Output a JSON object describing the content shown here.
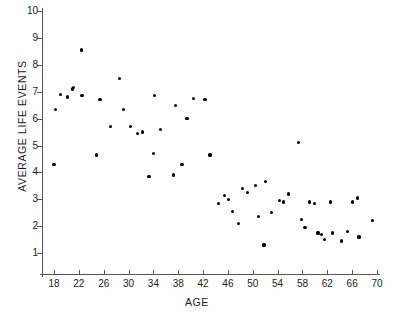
{
  "chart_data": {
    "type": "scatter",
    "title": "",
    "xlabel": "AGE",
    "ylabel": "AVERAGE LIFE EVENTS",
    "xlim": [
      16,
      71
    ],
    "ylim": [
      0.4,
      10
    ],
    "grid": false,
    "legend": null,
    "xticks": [
      18,
      22,
      26,
      30,
      34,
      38,
      42,
      46,
      50,
      54,
      58,
      62,
      66,
      70
    ],
    "yticks": [
      1,
      2,
      3,
      4,
      5,
      6,
      7,
      8,
      9,
      10
    ],
    "marker": "filled-circle",
    "marker_color": "#000000",
    "points": [
      {
        "x": 18.0,
        "y": 4.3
      },
      {
        "x": 18.3,
        "y": 6.35
      },
      {
        "x": 19.0,
        "y": 6.9
      },
      {
        "x": 20.2,
        "y": 6.8
      },
      {
        "x": 21.0,
        "y": 7.1
      },
      {
        "x": 21.2,
        "y": 7.15
      },
      {
        "x": 22.4,
        "y": 8.55
      },
      {
        "x": 22.5,
        "y": 6.85
      },
      {
        "x": 24.8,
        "y": 4.65
      },
      {
        "x": 25.4,
        "y": 6.7
      },
      {
        "x": 27.1,
        "y": 5.7
      },
      {
        "x": 28.6,
        "y": 7.5
      },
      {
        "x": 29.2,
        "y": 6.35
      },
      {
        "x": 30.3,
        "y": 5.7
      },
      {
        "x": 31.5,
        "y": 5.45
      },
      {
        "x": 32.2,
        "y": 5.5
      },
      {
        "x": 33.3,
        "y": 3.85
      },
      {
        "x": 34.0,
        "y": 4.7
      },
      {
        "x": 34.2,
        "y": 6.85
      },
      {
        "x": 35.1,
        "y": 5.6
      },
      {
        "x": 37.2,
        "y": 3.9
      },
      {
        "x": 37.6,
        "y": 6.5
      },
      {
        "x": 38.6,
        "y": 4.3
      },
      {
        "x": 39.4,
        "y": 6.0
      },
      {
        "x": 40.4,
        "y": 6.75
      },
      {
        "x": 42.3,
        "y": 6.7
      },
      {
        "x": 43.1,
        "y": 4.65
      },
      {
        "x": 44.5,
        "y": 2.85
      },
      {
        "x": 45.5,
        "y": 3.15
      },
      {
        "x": 46.1,
        "y": 3.0
      },
      {
        "x": 46.8,
        "y": 2.55
      },
      {
        "x": 47.7,
        "y": 2.1
      },
      {
        "x": 48.4,
        "y": 3.4
      },
      {
        "x": 49.1,
        "y": 3.25
      },
      {
        "x": 50.4,
        "y": 3.5
      },
      {
        "x": 50.9,
        "y": 2.35
      },
      {
        "x": 51.8,
        "y": 1.3
      },
      {
        "x": 52.1,
        "y": 3.65
      },
      {
        "x": 53.0,
        "y": 2.5
      },
      {
        "x": 54.3,
        "y": 2.95
      },
      {
        "x": 55.0,
        "y": 2.9
      },
      {
        "x": 55.7,
        "y": 3.2
      },
      {
        "x": 57.4,
        "y": 5.1
      },
      {
        "x": 57.8,
        "y": 2.25
      },
      {
        "x": 58.4,
        "y": 1.95
      },
      {
        "x": 59.1,
        "y": 2.9
      },
      {
        "x": 60.0,
        "y": 2.85
      },
      {
        "x": 60.5,
        "y": 1.75
      },
      {
        "x": 61.0,
        "y": 1.7
      },
      {
        "x": 61.6,
        "y": 1.5
      },
      {
        "x": 62.5,
        "y": 2.9
      },
      {
        "x": 62.8,
        "y": 1.75
      },
      {
        "x": 64.3,
        "y": 1.45
      },
      {
        "x": 65.2,
        "y": 1.8
      },
      {
        "x": 66.0,
        "y": 2.9
      },
      {
        "x": 66.9,
        "y": 3.05
      },
      {
        "x": 67.1,
        "y": 1.6
      },
      {
        "x": 69.3,
        "y": 2.2
      }
    ]
  }
}
